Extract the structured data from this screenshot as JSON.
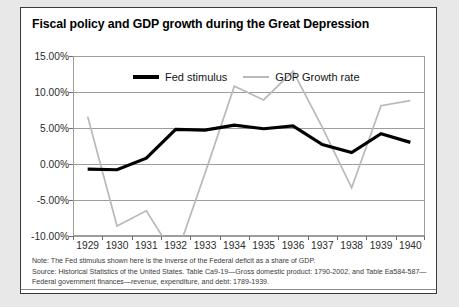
{
  "chart_data": {
    "type": "line",
    "title": "Fiscal policy and GDP growth during the Great Depression",
    "xlabel": "",
    "ylabel": "",
    "ylim": [
      -10,
      15
    ],
    "yticks": [
      15,
      10,
      5,
      0,
      -5,
      -10
    ],
    "ytick_labels": [
      "15.00%",
      "10.00%",
      "5.00%",
      "0.00%",
      "-5.00%",
      "-10.00%"
    ],
    "grid": true,
    "legend_position": "top-center",
    "categories": [
      "1929",
      "1930",
      "1931",
      "1932",
      "1933",
      "1934",
      "1935",
      "1936",
      "1937",
      "1938",
      "1939",
      "1940"
    ],
    "x": [
      1929,
      1930,
      1931,
      1932,
      1933,
      1934,
      1935,
      1936,
      1937,
      1938,
      1939,
      1940
    ],
    "series": [
      {
        "name": "Fed stimulus",
        "color": "#000000",
        "values": [
          -0.7,
          -0.8,
          0.8,
          4.8,
          4.7,
          5.4,
          4.9,
          5.3,
          2.7,
          1.6,
          4.2,
          3.0
        ]
      },
      {
        "name": "GDP Growth rate",
        "color": "#b9b9b9",
        "values": [
          6.6,
          -8.6,
          -6.5,
          -13.0,
          -1.3,
          10.8,
          8.9,
          12.9,
          5.1,
          -3.3,
          8.1,
          8.8
        ]
      }
    ]
  },
  "legend": {
    "entries": [
      {
        "label": "Fed stimulus",
        "swatch": "black-thick-line"
      },
      {
        "label": "GDP Growth rate",
        "swatch": "gray-thin-line"
      }
    ]
  },
  "notes": {
    "line1": "Note: The Fed stimulus shown here is the inverse of the Federal deficit as a share of GDP.",
    "line2": "Source: Historical Statistics of the United States. Table Ca9-19—Gross domestic product: 1790-2002, and Table Ea584-587—",
    "line3": "Federal government finances—revenue, expenditure, and debt: 1789-1939."
  },
  "colors": {
    "fed_stimulus": "#000000",
    "gdp_growth": "#b9b9b9",
    "gridline": "#9d9d9d",
    "border": "#3b3b3b",
    "page_background": "#e8e8e8",
    "figure_background": "#ffffff"
  }
}
